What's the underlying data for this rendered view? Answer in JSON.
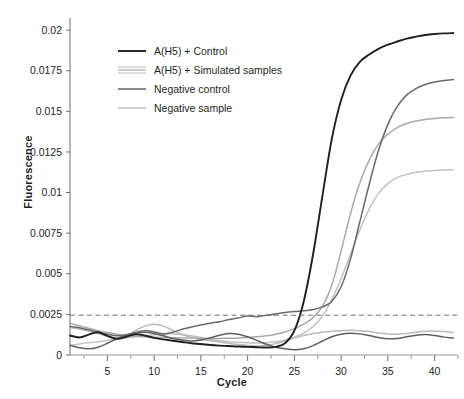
{
  "chart_data": {
    "type": "line",
    "title": "",
    "xlabel": "Cycle",
    "ylabel": "Fluorescence",
    "xlim": [
      1,
      42.5
    ],
    "ylim": [
      0,
      0.0205
    ],
    "grid": false,
    "legend_position": "upper-left",
    "x_ticks": [
      5,
      10,
      15,
      20,
      25,
      30,
      35,
      40
    ],
    "x_minor_ticks": [
      2.5,
      7.5,
      12.5,
      17.5,
      22.5,
      27.5,
      32.5,
      37.5,
      42.5
    ],
    "y_ticks": [
      0,
      0.0025,
      0.005,
      0.0075,
      0.01,
      0.0125,
      0.015,
      0.0175,
      0.02
    ],
    "y_tick_labels": [
      "0",
      "0.0025",
      "0.005",
      "0.0075",
      "0.01",
      "0.0125",
      "0.015",
      "0.0175",
      "0.02"
    ],
    "threshold": {
      "value": 0.00245,
      "style": "dashed",
      "color": "#6f6f6f",
      "label": ""
    },
    "colors": {
      "control": "#231f20",
      "simulated_a": "#6a6a6a",
      "simulated_b": "#a9a9a9",
      "simulated_c": "#c2c2c2",
      "negative_control": "#5f5f5f",
      "negative_sample": "#b9b9b9"
    },
    "legend": [
      {
        "label": "A(H5) + Control",
        "color": "#231f20",
        "style": "single"
      },
      {
        "label": "A(H5) + Simulated samples",
        "color": "#b0b0b0",
        "style": "triple"
      },
      {
        "label": "Negative control",
        "color": "#5f5f5f",
        "style": "single"
      },
      {
        "label": "Negative sample",
        "color": "#bdbdbd",
        "style": "single"
      }
    ],
    "x": [
      1,
      2,
      3,
      4,
      5,
      6,
      7,
      8,
      9,
      10,
      11,
      12,
      13,
      14,
      15,
      16,
      17,
      18,
      19,
      20,
      21,
      22,
      23,
      24,
      25,
      26,
      27,
      28,
      29,
      30,
      31,
      32,
      33,
      34,
      35,
      36,
      37,
      38,
      39,
      40,
      41,
      42
    ],
    "series": [
      {
        "name": "A(H5) + Control",
        "color": "#231f20",
        "width": 1.9,
        "values": [
          0.0012,
          0.00108,
          0.00125,
          0.0014,
          0.00118,
          0.001,
          0.00112,
          0.00128,
          0.0012,
          0.00105,
          0.00096,
          0.00088,
          0.0008,
          0.00072,
          0.00068,
          0.00062,
          0.00058,
          0.00055,
          0.00052,
          0.0005,
          0.00048,
          0.00046,
          0.0005,
          0.00072,
          0.0015,
          0.0033,
          0.0062,
          0.0098,
          0.0133,
          0.0157,
          0.0172,
          0.01805,
          0.0185,
          0.01885,
          0.0191,
          0.0193,
          0.01948,
          0.0196,
          0.0197,
          0.01976,
          0.0198,
          0.01982
        ]
      },
      {
        "name": "A(H5) + Simulated sample 1",
        "color": "#6a6a6a",
        "width": 1.5,
        "values": [
          0.00175,
          0.00168,
          0.00155,
          0.0014,
          0.00128,
          0.00118,
          0.00125,
          0.00138,
          0.0015,
          0.00142,
          0.0013,
          0.0014,
          0.00158,
          0.00172,
          0.00185,
          0.00196,
          0.00205,
          0.00218,
          0.00228,
          0.0024,
          0.00236,
          0.00244,
          0.00252,
          0.00262,
          0.00268,
          0.00272,
          0.0028,
          0.00296,
          0.0033,
          0.0042,
          0.0059,
          0.0082,
          0.0105,
          0.0126,
          0.0142,
          0.0153,
          0.016,
          0.0164,
          0.01665,
          0.0168,
          0.0169,
          0.01696
        ]
      },
      {
        "name": "A(H5) + Simulated sample 2",
        "color": "#a9a9a9",
        "width": 1.5,
        "values": [
          0.00195,
          0.0018,
          0.00165,
          0.0015,
          0.00138,
          0.00128,
          0.0012,
          0.00115,
          0.00112,
          0.0011,
          0.00108,
          0.00106,
          0.00105,
          0.00104,
          0.00103,
          0.00102,
          0.00102,
          0.00103,
          0.00105,
          0.00108,
          0.00112,
          0.00118,
          0.00128,
          0.00142,
          0.00162,
          0.0019,
          0.0023,
          0.003,
          0.0043,
          0.0064,
          0.0087,
          0.0106,
          0.012,
          0.013,
          0.0136,
          0.014,
          0.01425,
          0.0144,
          0.0145,
          0.01456,
          0.0146,
          0.01462
        ]
      },
      {
        "name": "A(H5) + Simulated sample 3",
        "color": "#c2c2c2",
        "width": 1.5,
        "values": [
          0.0006,
          0.00068,
          0.00075,
          0.00082,
          0.0009,
          0.00098,
          0.00105,
          0.00112,
          0.00118,
          0.00124,
          0.00128,
          0.0013,
          0.00126,
          0.00118,
          0.00108,
          0.00096,
          0.00088,
          0.00082,
          0.00078,
          0.00075,
          0.00074,
          0.00076,
          0.00082,
          0.00092,
          0.0011,
          0.00135,
          0.00175,
          0.0024,
          0.0034,
          0.0047,
          0.0062,
          0.0077,
          0.009,
          0.00995,
          0.01055,
          0.01092,
          0.01112,
          0.01125,
          0.01132,
          0.01136,
          0.01139,
          0.01141
        ]
      },
      {
        "name": "Negative control",
        "color": "#5f5f5f",
        "width": 1.5,
        "values": [
          0.0006,
          0.00045,
          0.00038,
          0.00048,
          0.00072,
          0.001,
          0.00122,
          0.00135,
          0.0014,
          0.00132,
          0.00118,
          0.00102,
          0.00092,
          0.00086,
          0.00092,
          0.00106,
          0.00122,
          0.00132,
          0.00128,
          0.00112,
          0.0009,
          0.00066,
          0.00048,
          0.00038,
          0.00032,
          0.00038,
          0.00058,
          0.00086,
          0.00112,
          0.00128,
          0.00134,
          0.0013,
          0.0012,
          0.00108,
          0.001,
          0.00102,
          0.00112,
          0.00122,
          0.00126,
          0.0012,
          0.0011,
          0.00104
        ]
      },
      {
        "name": "Negative sample",
        "color": "#b9b9b9",
        "width": 1.5,
        "values": [
          0.00168,
          0.0016,
          0.00148,
          0.00132,
          0.00116,
          0.00102,
          0.00118,
          0.0015,
          0.00178,
          0.0019,
          0.00178,
          0.00152,
          0.00126,
          0.00108,
          0.00096,
          0.00088,
          0.0008,
          0.00072,
          0.00064,
          0.00058,
          0.00056,
          0.0006,
          0.0007,
          0.00086,
          0.00104,
          0.0012,
          0.00132,
          0.0014,
          0.00146,
          0.0015,
          0.00152,
          0.0015,
          0.00144,
          0.00136,
          0.0013,
          0.00128,
          0.00132,
          0.0014,
          0.00146,
          0.00148,
          0.00144,
          0.00138
        ]
      }
    ]
  }
}
